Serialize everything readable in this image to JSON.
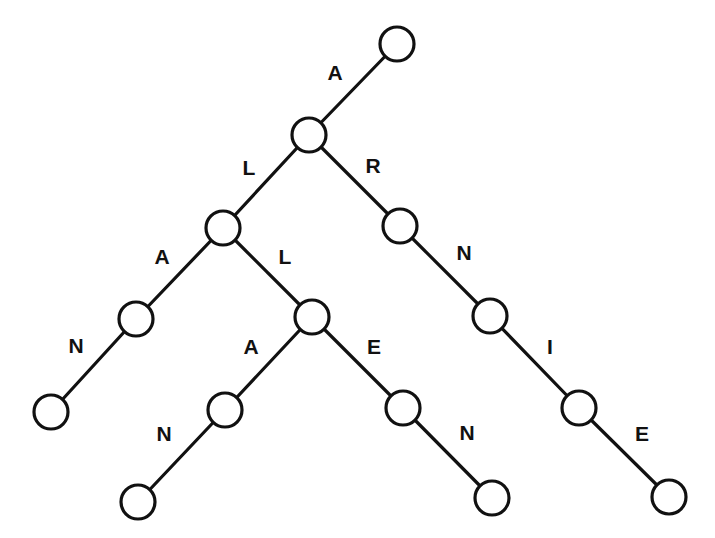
{
  "diagram": {
    "type": "trie",
    "node_radius": 17,
    "colors": {
      "stroke": "#111111",
      "background": "#ffffff"
    },
    "nodes": [
      {
        "id": "root",
        "x": 397,
        "y": 44
      },
      {
        "id": "A",
        "x": 309,
        "y": 135
      },
      {
        "id": "AL",
        "x": 223,
        "y": 228
      },
      {
        "id": "AR",
        "x": 400,
        "y": 226
      },
      {
        "id": "ALA",
        "x": 136,
        "y": 319
      },
      {
        "id": "ALL",
        "x": 312,
        "y": 317
      },
      {
        "id": "ARN",
        "x": 490,
        "y": 316
      },
      {
        "id": "ALAN",
        "x": 51,
        "y": 412
      },
      {
        "id": "ALLA",
        "x": 225,
        "y": 410
      },
      {
        "id": "ALLE",
        "x": 403,
        "y": 408
      },
      {
        "id": "ARNI",
        "x": 579,
        "y": 408
      },
      {
        "id": "ALLAN",
        "x": 138,
        "y": 502
      },
      {
        "id": "ALLEN",
        "x": 492,
        "y": 498
      },
      {
        "id": "ARNIE",
        "x": 669,
        "y": 497
      }
    ],
    "edges": [
      {
        "from": "root",
        "to": "A",
        "label": "A",
        "lx": 335,
        "ly": 72
      },
      {
        "from": "A",
        "to": "AL",
        "label": "L",
        "lx": 249,
        "ly": 167
      },
      {
        "from": "A",
        "to": "AR",
        "label": "R",
        "lx": 373,
        "ly": 165
      },
      {
        "from": "AL",
        "to": "ALA",
        "label": "A",
        "lx": 162,
        "ly": 256
      },
      {
        "from": "AL",
        "to": "ALL",
        "label": "L",
        "lx": 285,
        "ly": 256
      },
      {
        "from": "AR",
        "to": "ARN",
        "label": "N",
        "lx": 464,
        "ly": 252
      },
      {
        "from": "ALA",
        "to": "ALAN",
        "label": "N",
        "lx": 76,
        "ly": 345
      },
      {
        "from": "ALL",
        "to": "ALLA",
        "label": "A",
        "lx": 251,
        "ly": 346
      },
      {
        "from": "ALL",
        "to": "ALLE",
        "label": "E",
        "lx": 374,
        "ly": 346
      },
      {
        "from": "ARN",
        "to": "ARNI",
        "label": "I",
        "lx": 550,
        "ly": 346
      },
      {
        "from": "ALLA",
        "to": "ALLAN",
        "label": "N",
        "lx": 164,
        "ly": 433
      },
      {
        "from": "ALLE",
        "to": "ALLEN",
        "label": "N",
        "lx": 467,
        "ly": 432
      },
      {
        "from": "ARNI",
        "to": "ARNIE",
        "label": "E",
        "lx": 642,
        "ly": 433
      }
    ]
  }
}
